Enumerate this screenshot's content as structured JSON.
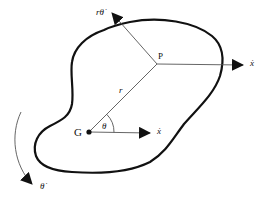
{
  "diagram": {
    "type": "rigid-body kinematics",
    "colors": {
      "outline": "#111111",
      "line": "#555555",
      "arrow": "#111111",
      "background": "#ffffff"
    },
    "points": {
      "G": {
        "label": "G",
        "x": 89,
        "y": 132
      },
      "P": {
        "label": "P",
        "x": 157,
        "y": 64
      }
    },
    "labels": {
      "point_g": "G",
      "point_p": "P",
      "position_vector": "r",
      "angle": "θ",
      "velocity_p_x": "ẋ",
      "velocity_g_x": "ẋ",
      "tangential_velocity": "rθ̇",
      "angular_velocity": "θ̇"
    },
    "arrows": [
      {
        "name": "velocity-p-x",
        "from": [
          157,
          64
        ],
        "to": [
          243,
          65
        ],
        "label": "ẋ"
      },
      {
        "name": "velocity-g-x",
        "from": [
          89,
          132
        ],
        "to": [
          150,
          133
        ],
        "label": "ẋ"
      },
      {
        "name": "tangential-velocity",
        "from": [
          157,
          64
        ],
        "to": [
          112,
          13
        ],
        "label": "rθ̇"
      },
      {
        "name": "angular-velocity",
        "curved": true,
        "label": "θ̇"
      }
    ],
    "segments": [
      {
        "name": "radius-line",
        "from": [
          89,
          132
        ],
        "to": [
          157,
          64
        ],
        "label": "r"
      }
    ]
  }
}
